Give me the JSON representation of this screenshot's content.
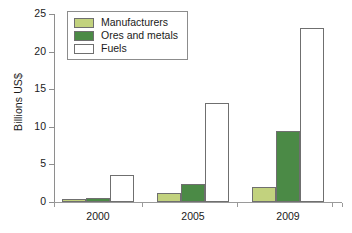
{
  "chart_data": {
    "type": "bar",
    "title": "",
    "subtitle": "",
    "xlabel": "",
    "ylabel": "Billions US$",
    "categories": [
      "2000",
      "2005",
      "2009"
    ],
    "series": [
      {
        "name": "Manufacturers",
        "color": "#c2d27e",
        "values": [
          0.4,
          1.2,
          2.0
        ]
      },
      {
        "name": "Ores and metals",
        "color": "#4b8a46",
        "values": [
          0.5,
          2.4,
          9.5
        ]
      },
      {
        "name": "Fuels",
        "color": "#ffffff",
        "values": [
          3.6,
          13.2,
          23.2
        ]
      }
    ],
    "ylim": [
      0,
      25
    ],
    "yticks": [
      0,
      5,
      10,
      15,
      20,
      25
    ],
    "ytick_labels": [
      "0",
      "5",
      "10",
      "15",
      "20",
      "25"
    ],
    "grid": false,
    "legend_position": "top-left",
    "bar_edge_color": "#6f6f6f",
    "axis_color": "#8e8e8e"
  },
  "legend": {
    "items": [
      {
        "label": "Manufacturers"
      },
      {
        "label": "Ores and metals"
      },
      {
        "label": "Fuels"
      }
    ]
  }
}
